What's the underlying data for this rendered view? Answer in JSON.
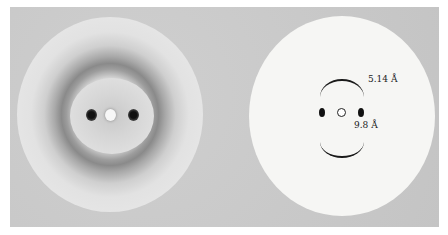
{
  "figure": {
    "left_panel": {
      "description": "X-ray fiber diffraction photograph"
    },
    "right_panel": {
      "description": "Schematic of diffraction pattern",
      "labels": {
        "arc_spacing": "5.14 Å",
        "equatorial_spacing": "9.8 Å"
      }
    }
  }
}
